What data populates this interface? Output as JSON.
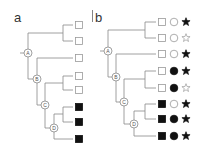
{
  "panels": [
    {
      "label": "a",
      "nodes": [
        "A",
        "B",
        "C",
        "D"
      ],
      "tips": [
        {
          "square": "open"
        },
        {
          "square": "open"
        },
        {
          "square": "open"
        },
        {
          "square": "open"
        },
        {
          "square": "open"
        },
        {
          "square": "filled"
        },
        {
          "square": "filled"
        },
        {
          "square": "filled"
        }
      ]
    },
    {
      "label": "b",
      "nodes": [
        "A",
        "B",
        "C",
        "D"
      ],
      "tips": [
        {
          "square": "open",
          "circle": "open",
          "star": "filled"
        },
        {
          "square": "open",
          "circle": "open",
          "star": "open"
        },
        {
          "square": "open",
          "circle": "open",
          "star": "filled"
        },
        {
          "square": "open",
          "circle": "filled",
          "star": "filled"
        },
        {
          "square": "open",
          "circle": "filled",
          "star": "open"
        },
        {
          "square": "filled",
          "circle": "open",
          "star": "filled"
        },
        {
          "square": "filled",
          "circle": "filled",
          "star": "filled"
        },
        {
          "square": "filled",
          "circle": "filled",
          "star": "filled"
        }
      ]
    }
  ],
  "colors": {
    "line": "#888888",
    "fill": "#111111",
    "open_stroke": "#999999"
  }
}
